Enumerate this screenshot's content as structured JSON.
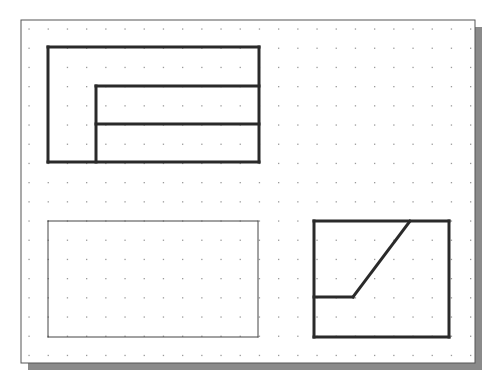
{
  "drawing": {
    "sheet": {
      "x": 21,
      "y": 20,
      "width": 454,
      "height": 343,
      "border_color": "#555555",
      "shadow_color": "#8a8a8a",
      "shadow_offset": 7
    },
    "grid": {
      "x0": 29,
      "y0": 29,
      "spacing": 19.2,
      "cols": 24,
      "rows": 18,
      "dot_color": "#9a9a9a"
    },
    "views": [
      {
        "name": "top-view",
        "lines": [
          [
            48,
            47,
            259,
            47
          ],
          [
            259,
            47,
            259,
            162
          ],
          [
            259,
            162,
            48,
            162
          ],
          [
            48,
            162,
            48,
            47
          ],
          [
            96,
            86,
            259,
            86
          ],
          [
            96,
            86,
            96,
            162
          ],
          [
            96,
            124,
            259,
            124
          ]
        ],
        "stroke": 3,
        "color": "#2a2a2a"
      },
      {
        "name": "front-view",
        "lines": [
          [
            48,
            221,
            258,
            221
          ],
          [
            258,
            221,
            258,
            337
          ],
          [
            258,
            337,
            48,
            337
          ],
          [
            48,
            337,
            48,
            221
          ]
        ],
        "stroke": 1,
        "color": "#444444"
      },
      {
        "name": "side-view",
        "lines": [
          [
            314,
            221,
            449,
            221
          ],
          [
            449,
            221,
            449,
            337
          ],
          [
            449,
            337,
            314,
            337
          ],
          [
            314,
            337,
            314,
            221
          ],
          [
            410,
            221,
            353,
            297
          ],
          [
            353,
            297,
            314,
            297
          ]
        ],
        "stroke": 3,
        "color": "#2a2a2a"
      }
    ]
  }
}
